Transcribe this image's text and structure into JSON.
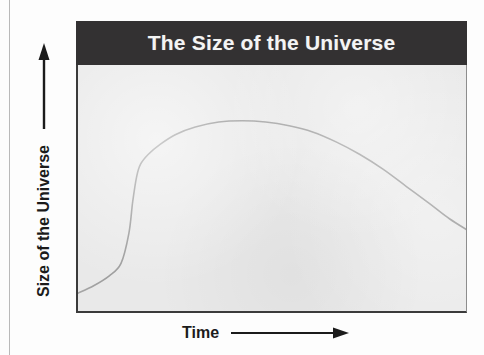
{
  "figure": {
    "title": "The Size of the Universe",
    "y_axis_label": "Size of the Universe",
    "x_axis_label": "Time",
    "y_axis_arrow_icon": "arrow-up-icon",
    "x_axis_arrow_icon": "arrow-right-icon",
    "colors": {
      "banner": "#333132",
      "banner_text": "#f4f4f4",
      "plot_background": "#e9e9e9",
      "axis": "#3b3b3b",
      "curve": "#9a9a9a",
      "label_text": "#1b1b1b"
    }
  },
  "chart_data": {
    "type": "line",
    "title": "The Size of the Universe",
    "xlabel": "Time",
    "ylabel": "Size of the Universe",
    "xlim": [
      0,
      100
    ],
    "ylim": [
      0,
      100
    ],
    "grid": false,
    "legend": null,
    "axis_tick_labels": {
      "x": [],
      "y": []
    },
    "annotations": [],
    "series": [
      {
        "name": "Size of the Universe",
        "x": [
          0,
          4,
          8,
          11,
          13,
          14,
          15,
          16,
          18,
          21,
          25,
          30,
          36,
          42,
          48,
          54,
          60,
          66,
          72,
          78,
          84,
          90,
          95,
          100
        ],
        "y": [
          8,
          11,
          15,
          20,
          32,
          45,
          55,
          60,
          64,
          68,
          72,
          75,
          77,
          77.5,
          77,
          75.5,
          73,
          69,
          64,
          58,
          51,
          44,
          38,
          33
        ]
      }
    ]
  }
}
